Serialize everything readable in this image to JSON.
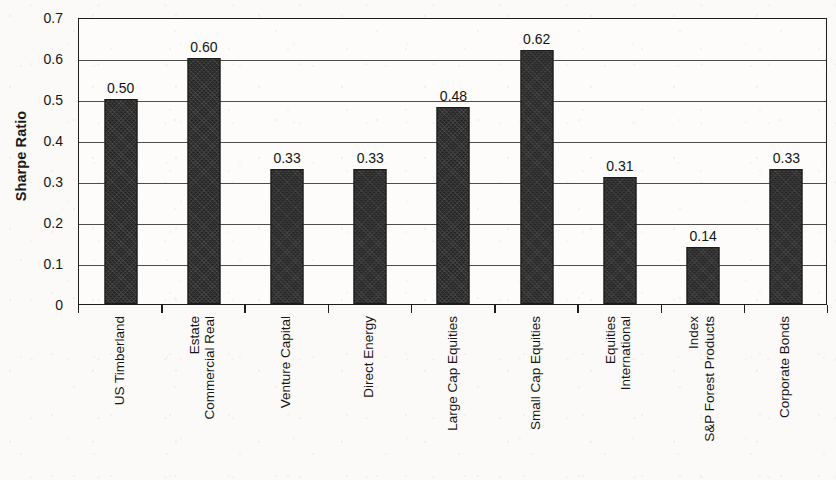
{
  "chart_data": {
    "type": "bar",
    "title": "",
    "xlabel": "",
    "ylabel": "Sharpe Ratio",
    "ylim": [
      0,
      0.7
    ],
    "ytick_values": [
      0,
      0.1,
      0.2,
      0.3,
      0.4,
      0.5,
      0.6,
      0.7
    ],
    "ytick_labels": [
      "0",
      "0.1",
      "0.2",
      "0.3",
      "0.4",
      "0.5",
      "0.6",
      "0.7"
    ],
    "grid": "horizontal",
    "legend": "none",
    "bar_color": "#2e2e2e",
    "categories": [
      "US Timberland",
      "Commercial Real Estate",
      "Venture Capital",
      "Direct Energy",
      "Large Cap Equities",
      "Small Cap Equities",
      "International Equities",
      "S&P Forest Products Index",
      "Corporate Bonds"
    ],
    "category_label_lines": [
      [
        "US Timberland"
      ],
      [
        "Commercial Real",
        "Estate"
      ],
      [
        "Venture Capital"
      ],
      [
        "Direct Energy"
      ],
      [
        "Large Cap Equities"
      ],
      [
        "Small Cap Equities"
      ],
      [
        "International",
        "Equities"
      ],
      [
        "S&P Forest Products",
        "Index"
      ],
      [
        "Corporate Bonds"
      ]
    ],
    "values": [
      0.5,
      0.6,
      0.33,
      0.33,
      0.48,
      0.62,
      0.31,
      0.14,
      0.33
    ],
    "value_labels": [
      "0.50",
      "0.60",
      "0.33",
      "0.33",
      "0.48",
      "0.62",
      "0.31",
      "0.14",
      "0.33"
    ]
  }
}
